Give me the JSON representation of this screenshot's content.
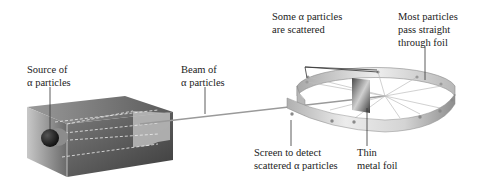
{
  "labels": {
    "source": {
      "line1": "Source of",
      "line2": "α particles"
    },
    "beam": {
      "line1": "Beam of",
      "line2": "α particles"
    },
    "scattered": {
      "line1": "Some α particles",
      "line2": "are scattered"
    },
    "straight": {
      "line1": "Most particles",
      "line2": "pass straight",
      "line3": "through foil"
    },
    "screen": {
      "line1": "Screen to detect",
      "line2": "scattered α particles"
    },
    "foil": {
      "line1": "Thin",
      "line2": "metal foil"
    }
  },
  "colors": {
    "box_dark": "#3a3a3a",
    "box_mid": "#6e6e6e",
    "ring_light": "#e6e6e6",
    "ring_shade": "#9a9a9a",
    "leader": "#333333"
  }
}
